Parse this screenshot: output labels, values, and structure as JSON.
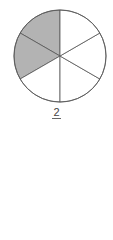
{
  "diagram": {
    "type": "fraction-circle",
    "total_parts": 6,
    "shaded_parts": 2,
    "shaded_color": "#b3b3b3",
    "unshaded_color": "#ffffff",
    "stroke_color": "#555555",
    "center": [
      60,
      56
    ],
    "radius": 46
  },
  "label": {
    "numerator": "2",
    "denominator": ""
  }
}
